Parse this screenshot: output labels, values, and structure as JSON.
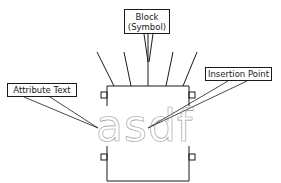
{
  "diagram": {
    "callouts": {
      "block_line1": "Block",
      "block_line2": "(Symbol)",
      "attribute_text": "Attribute Text",
      "insertion_point": "Insertion Point"
    },
    "attribute_value": "asdf",
    "colors": {
      "line": "#1a1a1a",
      "attribute_text": "#9a9a9a",
      "background": "#ffffff"
    }
  }
}
